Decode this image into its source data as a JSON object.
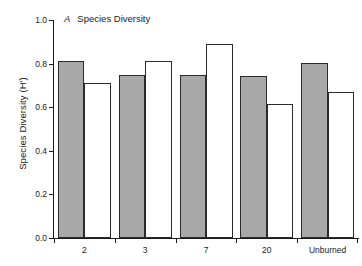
{
  "chart_data": {
    "type": "bar",
    "title": "Species Diversity",
    "panel_letter": "A",
    "xlabel": "",
    "ylabel": "Species Diversity (H')",
    "categories": [
      "2",
      "3",
      "7",
      "20",
      "Unburned"
    ],
    "ylim": [
      0.0,
      1.0
    ],
    "yticks": [
      "0.0",
      "0.2",
      "0.4",
      "0.6",
      "0.8",
      "1.0"
    ],
    "ytick_values": [
      0.0,
      0.2,
      0.4,
      0.6,
      0.8,
      1.0
    ],
    "grid": false,
    "legend": "none",
    "series": [
      {
        "name": "shaded",
        "fill": "#a8a8a8",
        "values": [
          0.81,
          0.75,
          0.75,
          0.745,
          0.805
        ]
      },
      {
        "name": "open",
        "fill": "#ffffff",
        "values": [
          0.71,
          0.81,
          0.89,
          0.615,
          0.67
        ]
      }
    ]
  },
  "colors": {
    "shaded_bar": "#a8a8a8",
    "open_bar": "#ffffff",
    "bar_edge": "#2b2b2b",
    "axis": "#1a1a1a",
    "background": "#ffffff"
  }
}
